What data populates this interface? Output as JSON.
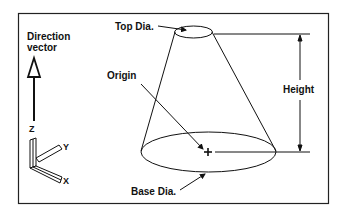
{
  "diagram": {
    "type": "cone-parameters",
    "labels": {
      "direction_vector_line1": "Direction",
      "direction_vector_line2": "vector",
      "top_dia": "Top Dia.",
      "origin": "Origin",
      "height": "Height",
      "base_dia": "Base Dia.",
      "axis_z": "Z",
      "axis_y": "Y",
      "axis_x": "X"
    },
    "colors": {
      "stroke": "#111111",
      "background": "#ffffff",
      "frame": "#222222"
    }
  }
}
